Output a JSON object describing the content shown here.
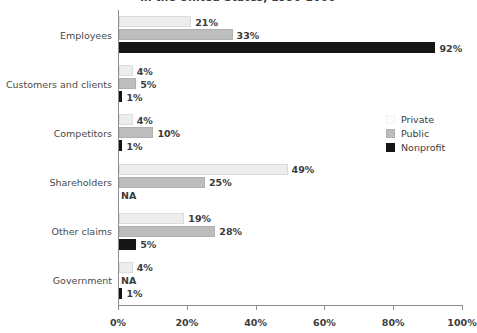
{
  "chart_data": {
    "type": "bar",
    "orientation": "horizontal",
    "title": "in the United States, 1990-2000",
    "xlabel": "",
    "ylabel": "",
    "xlim": [
      0,
      100
    ],
    "xticks": [
      "0%",
      "20%",
      "40%",
      "60%",
      "80%",
      "100%"
    ],
    "xtick_values": [
      0,
      20,
      40,
      60,
      80,
      100
    ],
    "grid": false,
    "legend_position": "right",
    "categories": [
      "Employees",
      "Customers and clients",
      "Competitors",
      "Shareholders",
      "Other claims",
      "Government"
    ],
    "series": [
      {
        "name": "Private",
        "color": "#ededed",
        "values": [
          21,
          4,
          4,
          49,
          19,
          4
        ],
        "labels": [
          "21%",
          "4%",
          "4%",
          "49%",
          "19%",
          "4%"
        ]
      },
      {
        "name": "Public",
        "color": "#bdbdbd",
        "values": [
          33,
          5,
          10,
          25,
          28,
          null
        ],
        "labels": [
          "33%",
          "5%",
          "10%",
          "25%",
          "28%",
          "NA"
        ]
      },
      {
        "name": "Nonprofit",
        "color": "#151515",
        "values": [
          92,
          1,
          1,
          null,
          5,
          1
        ],
        "labels": [
          "92%",
          "1%",
          "1%",
          "NA",
          "5%",
          "1%"
        ]
      }
    ]
  },
  "legend": {
    "entries": [
      {
        "label": "Private",
        "swatch": "private"
      },
      {
        "label": "Public",
        "swatch": "public"
      },
      {
        "label": "Nonprofit",
        "swatch": "nonprofit"
      }
    ]
  },
  "colors": {
    "private": "#ededed",
    "public": "#bdbdbd",
    "nonprofit": "#151515",
    "axis": "#8d8d8d",
    "text": "#3c3c3c"
  }
}
